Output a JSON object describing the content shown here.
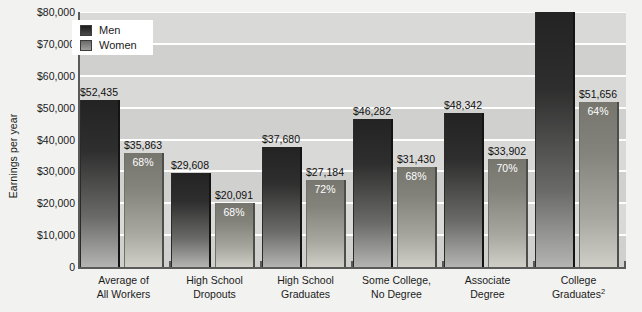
{
  "chart_data": {
    "type": "bar",
    "title": "",
    "subtitle": "",
    "xlabel": "",
    "ylabel": "Earnings per year",
    "ylim": [
      0,
      80000
    ],
    "ytick_labels": [
      "$80,000",
      "$70,000",
      "$60,000",
      "$50,000",
      "$40,000",
      "$30,000",
      "$20,000",
      "$10,000",
      "0"
    ],
    "ytick_values": [
      80000,
      70000,
      60000,
      50000,
      40000,
      30000,
      20000,
      10000,
      0
    ],
    "grid": true,
    "legend_position": "top-left",
    "categories": [
      "Average of\nAll Workers",
      "High School\nDropouts",
      "High School\nGraduates",
      "Some College,\nNo Degree",
      "Associate\nDegree",
      "College\nGraduates2"
    ],
    "series": [
      {
        "name": "Men",
        "color": "#232323",
        "values": [
          52435,
          29608,
          37680,
          46282,
          48342,
          80144
        ],
        "labels": [
          "$52,435",
          "$29,608",
          "$37,680",
          "$46,282",
          "$48,342",
          "$80,144"
        ]
      },
      {
        "name": "Women",
        "color": "#83837c",
        "values": [
          35863,
          20091,
          27184,
          31430,
          33902,
          51656
        ],
        "labels": [
          "$35,863",
          "$20,091",
          "$27,184",
          "$31,430",
          "$33,902",
          "$51,656"
        ],
        "pct_of_men": [
          "68%",
          "68%",
          "72%",
          "68%",
          "70%",
          "64%"
        ]
      }
    ]
  },
  "legend": {
    "items": [
      {
        "label": "Men"
      },
      {
        "label": "Women"
      }
    ]
  },
  "categories_display": [
    {
      "line1": "Average of",
      "line2": "All Workers",
      "sup": ""
    },
    {
      "line1": "High School",
      "line2": "Dropouts",
      "sup": ""
    },
    {
      "line1": "High School",
      "line2": "Graduates",
      "sup": ""
    },
    {
      "line1": "Some College,",
      "line2": "No Degree",
      "sup": ""
    },
    {
      "line1": "Associate",
      "line2": "Degree",
      "sup": ""
    },
    {
      "line1": "College",
      "line2": "Graduates",
      "sup": "2"
    }
  ],
  "colors": {
    "men_bar": "#232323",
    "women_bar": "#83837c",
    "plot_background": "#d9d9d7",
    "page_background": "#f2f2f0",
    "gridline": "#ffffff",
    "axis": "#5a5a58",
    "text": "#1b1b1b",
    "pct_text": "#ffffff"
  }
}
